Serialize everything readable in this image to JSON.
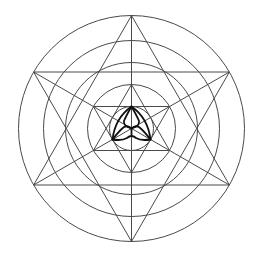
{
  "diagram": {
    "title": "Sacred geometry: concentric circles, nested hexagrams and central triquetra",
    "colors": {
      "background": "#ffffff",
      "line": "#4a4a4a",
      "knot": "#111111"
    },
    "center": [
      131.5,
      128.5
    ],
    "circles": [
      {
        "name": "outer-circle",
        "r": 113
      },
      {
        "name": "circle-2",
        "r": 88
      },
      {
        "name": "circle-3",
        "r": 66
      },
      {
        "name": "circle-4",
        "r": 44
      },
      {
        "name": "inner-circle",
        "r": 22
      }
    ],
    "outer_hexagram": {
      "radius": 113,
      "triangle_up": [
        [
          131.5,
          15.5
        ],
        [
          33.6,
          185
        ],
        [
          229.4,
          185
        ]
      ],
      "triangle_down": [
        [
          131.5,
          241.5
        ],
        [
          33.6,
          72
        ],
        [
          229.4,
          72
        ]
      ]
    },
    "inner_hexagram": {
      "radius": 44,
      "triangle_up": [
        [
          131.5,
          84.5
        ],
        [
          93.4,
          150.5
        ],
        [
          169.6,
          150.5
        ]
      ],
      "triangle_down": [
        [
          131.5,
          172.5
        ],
        [
          93.4,
          106.5
        ],
        [
          169.6,
          106.5
        ]
      ]
    },
    "axes": [
      [
        [
          131.5,
          15.5
        ],
        [
          131.5,
          241.5
        ]
      ],
      [
        [
          33.6,
          72
        ],
        [
          229.4,
          185
        ]
      ],
      [
        [
          229.4,
          72
        ],
        [
          33.6,
          185
        ]
      ]
    ],
    "triquetra": {
      "vertices": [
        [
          131.5,
          106.5
        ],
        [
          112.5,
          139.5
        ],
        [
          150.5,
          139.5
        ]
      ],
      "center": [
        131.5,
        128.5
      ]
    }
  }
}
